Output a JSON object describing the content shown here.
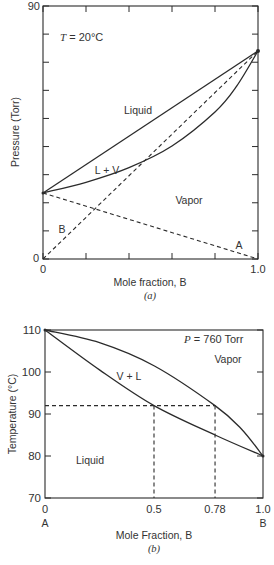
{
  "chart_data": [
    {
      "id": "a",
      "type": "line",
      "caption": "(a)",
      "title": "T = 20°C",
      "title_var": "T",
      "title_rest": " = 20°C",
      "xlabel": "Mole fraction, B",
      "ylabel": "Pressure (Torr)",
      "xlim": [
        0,
        1.0
      ],
      "ylim": [
        0,
        90
      ],
      "x_tick_labels": [
        "0",
        "1.0"
      ],
      "y_tick_labels": [
        "0",
        "90"
      ],
      "x_ticks": [
        0,
        0.2,
        0.4,
        0.6,
        0.8,
        1.0
      ],
      "y_ticks": [
        0,
        10,
        20,
        30,
        40,
        50,
        60,
        70,
        80,
        90
      ],
      "grid": false,
      "pure_A_pressure": 23.5,
      "pure_B_pressure": 74,
      "region_labels": [
        "Liquid",
        "L + V",
        "Vapor",
        "B",
        "A"
      ],
      "series": [
        {
          "name": "Liquid (bubble) line",
          "style": "solid",
          "x": [
            0,
            1.0
          ],
          "y": [
            23.5,
            74
          ]
        },
        {
          "name": "Vapor (dew) curve",
          "style": "solid",
          "x": [
            0,
            0.2,
            0.4,
            0.6,
            0.8,
            0.9,
            1.0
          ],
          "y": [
            23.5,
            27.3,
            32.5,
            40.2,
            52.3,
            61.4,
            74
          ]
        },
        {
          "name": "Partial pressure B",
          "style": "dashed",
          "x": [
            0,
            1.0
          ],
          "y": [
            0,
            74
          ]
        },
        {
          "name": "Partial pressure A",
          "style": "dashed",
          "x": [
            0,
            1.0
          ],
          "y": [
            23.5,
            0
          ]
        }
      ]
    },
    {
      "id": "b",
      "type": "line",
      "caption": "(b)",
      "title": "P = 760 Torr",
      "title_var": "P",
      "title_rest": " = 760 Torr",
      "xlabel": "Mole Fraction, B",
      "ylabel": "Temperature (°C)",
      "xlim": [
        0,
        1.0
      ],
      "ylim": [
        70,
        110
      ],
      "x_tick_labels": [
        "0",
        "0.5",
        "0.78",
        "1.0"
      ],
      "x_tick_values": [
        0,
        0.5,
        0.78,
        1.0
      ],
      "x_end_labels": [
        "A",
        "B"
      ],
      "y_tick_labels": [
        "70",
        "80",
        "90",
        "100",
        "110"
      ],
      "y_ticks": [
        70,
        80,
        90,
        100,
        110
      ],
      "grid": false,
      "region_labels": [
        "Vapor",
        "V + L",
        "Liquid"
      ],
      "series": [
        {
          "name": "Liquid (bubble) curve",
          "style": "solid",
          "x": [
            0,
            0.25,
            0.5,
            0.78,
            1.0
          ],
          "y": [
            110,
            100.5,
            92,
            85,
            80
          ]
        },
        {
          "name": "Vapor (dew) curve",
          "style": "solid",
          "x": [
            0,
            0.25,
            0.5,
            0.78,
            0.9,
            1.0
          ],
          "y": [
            110,
            107,
            101.5,
            92,
            86.5,
            80
          ]
        },
        {
          "name": "Tie line at 92°C",
          "style": "dashed",
          "x": [
            0,
            0.78
          ],
          "y": [
            92,
            92
          ]
        },
        {
          "name": "Liquid composition drop",
          "style": "dashed",
          "x": [
            0.5,
            0.5
          ],
          "y": [
            92,
            70
          ]
        },
        {
          "name": "Vapor composition drop",
          "style": "dashed",
          "x": [
            0.78,
            0.78
          ],
          "y": [
            92,
            70
          ]
        }
      ]
    }
  ]
}
